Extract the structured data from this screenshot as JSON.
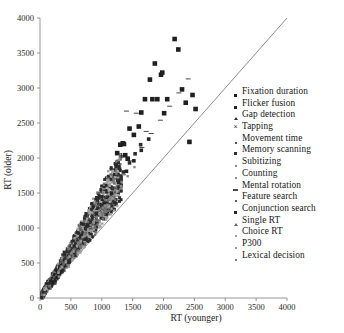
{
  "chart_data": {
    "type": "scatter",
    "title": "",
    "xlabel": "RT (younger)",
    "ylabel": "RT (older)",
    "xlim": [
      0,
      4000
    ],
    "ylim": [
      0,
      4000
    ],
    "xticks": [
      0,
      500,
      1000,
      1500,
      2000,
      2500,
      3000,
      3500,
      4000
    ],
    "yticks": [
      0,
      500,
      1000,
      1500,
      2000,
      2500,
      3000,
      3500,
      4000
    ],
    "grid": false,
    "legend_position": "right",
    "reference_line": {
      "name": "unity-line",
      "slope": 1,
      "intercept": 0
    },
    "series": [
      {
        "name": "Fixation duration",
        "marker": "square",
        "size": "large",
        "color": "#1c1c1c",
        "points": [
          [
            180,
            230
          ],
          [
            210,
            265
          ],
          [
            240,
            300
          ],
          [
            300,
            360
          ],
          [
            330,
            410
          ],
          [
            360,
            455
          ],
          [
            420,
            520
          ],
          [
            470,
            590
          ],
          [
            520,
            660
          ],
          [
            250,
            320
          ],
          [
            290,
            375
          ],
          [
            380,
            470
          ]
        ]
      },
      {
        "name": "Flicker fusion",
        "marker": "square",
        "size": "large",
        "color": "#202020",
        "points": [
          [
            1250,
            2070
          ],
          [
            1300,
            2190
          ],
          [
            1340,
            2210
          ],
          [
            1360,
            2200
          ],
          [
            1380,
            2040
          ],
          [
            1420,
            1990
          ],
          [
            1450,
            2420
          ],
          [
            1520,
            2330
          ],
          [
            1600,
            2450
          ],
          [
            1640,
            2650
          ],
          [
            1700,
            2840
          ],
          [
            1780,
            3120
          ],
          [
            1820,
            2840
          ],
          [
            1860,
            3350
          ],
          [
            1900,
            2840
          ],
          [
            1960,
            3190
          ],
          [
            1980,
            3220
          ],
          [
            2010,
            2640
          ],
          [
            2060,
            2840
          ],
          [
            2180,
            3700
          ],
          [
            2240,
            3550
          ],
          [
            2300,
            2980
          ],
          [
            2360,
            2790
          ],
          [
            2420,
            2230
          ],
          [
            2470,
            2900
          ],
          [
            2520,
            2700
          ]
        ]
      },
      {
        "name": "Gap detection",
        "marker": "triangle",
        "size": "medium",
        "color": "#2a2a2a",
        "points": [
          [
            520,
            700
          ],
          [
            610,
            830
          ],
          [
            690,
            930
          ],
          [
            760,
            1050
          ],
          [
            840,
            1180
          ],
          [
            920,
            1280
          ],
          [
            1010,
            1410
          ],
          [
            1080,
            1520
          ]
        ]
      },
      {
        "name": "Tapping",
        "marker": "x",
        "size": "small",
        "color": "#3a3a3a",
        "points": [
          [
            170,
            220
          ],
          [
            220,
            290
          ],
          [
            280,
            350
          ],
          [
            340,
            430
          ],
          [
            410,
            510
          ],
          [
            480,
            610
          ],
          [
            560,
            710
          ],
          [
            640,
            810
          ],
          [
            730,
            920
          ],
          [
            820,
            1030
          ],
          [
            900,
            1140
          ],
          [
            980,
            1250
          ],
          [
            1060,
            1360
          ],
          [
            1150,
            1470
          ],
          [
            1240,
            1600
          ],
          [
            1320,
            1720
          ]
        ]
      },
      {
        "name": "Movement time",
        "marker": "square",
        "size": "small",
        "color": "#555555",
        "points": [
          [
            230,
            300
          ],
          [
            310,
            400
          ],
          [
            400,
            500
          ],
          [
            490,
            620
          ],
          [
            580,
            730
          ],
          [
            670,
            840
          ],
          [
            760,
            950
          ],
          [
            850,
            1060
          ],
          [
            940,
            1180
          ],
          [
            1030,
            1290
          ],
          [
            1120,
            1400
          ],
          [
            1210,
            1510
          ]
        ]
      },
      {
        "name": "Memory scanning",
        "marker": "square",
        "size": "medium",
        "color": "#2e2e2e",
        "points": [
          [
            420,
            560
          ],
          [
            500,
            660
          ],
          [
            580,
            770
          ],
          [
            670,
            880
          ],
          [
            750,
            990
          ],
          [
            830,
            1100
          ],
          [
            910,
            1210
          ],
          [
            1000,
            1320
          ],
          [
            1090,
            1440
          ],
          [
            1170,
            1560
          ],
          [
            1260,
            1680
          ],
          [
            1350,
            1800
          ],
          [
            1450,
            1930
          ],
          [
            1540,
            2060
          ],
          [
            1630,
            2190
          ]
        ]
      },
      {
        "name": "Subitizing",
        "marker": "square",
        "size": "small",
        "color": "#787878",
        "points": [
          [
            300,
            380
          ],
          [
            380,
            480
          ],
          [
            460,
            580
          ],
          [
            540,
            680
          ],
          [
            620,
            780
          ],
          [
            700,
            880
          ],
          [
            780,
            980
          ],
          [
            860,
            1080
          ],
          [
            940,
            1190
          ],
          [
            1020,
            1290
          ]
        ]
      },
      {
        "name": "Counting",
        "marker": "square",
        "size": "small",
        "color": "#8a8a8a",
        "points": [
          [
            350,
            450
          ],
          [
            450,
            570
          ],
          [
            550,
            690
          ],
          [
            650,
            810
          ],
          [
            760,
            940
          ],
          [
            870,
            1070
          ],
          [
            980,
            1200
          ],
          [
            1090,
            1330
          ],
          [
            1200,
            1470
          ],
          [
            1310,
            1600
          ],
          [
            1420,
            1740
          ],
          [
            1530,
            1870
          ]
        ]
      },
      {
        "name": "Mental rotation",
        "marker": "dash",
        "size": "medium",
        "color": "#4a4a4a",
        "points": [
          [
            900,
            1180
          ],
          [
            1050,
            1380
          ],
          [
            1200,
            1570
          ],
          [
            1350,
            1760
          ],
          [
            1500,
            1960
          ],
          [
            1650,
            2150
          ],
          [
            1800,
            2350
          ],
          [
            1950,
            2540
          ],
          [
            2100,
            2740
          ],
          [
            2250,
            2930
          ],
          [
            1400,
            2670
          ],
          [
            1560,
            2640
          ],
          [
            1720,
            2380
          ],
          [
            2400,
            3130
          ]
        ]
      },
      {
        "name": "Feature search",
        "marker": "square",
        "size": "small",
        "color": "#606060",
        "points": [
          [
            380,
            490
          ],
          [
            470,
            600
          ],
          [
            560,
            710
          ],
          [
            650,
            820
          ],
          [
            740,
            930
          ],
          [
            830,
            1050
          ],
          [
            920,
            1160
          ],
          [
            1010,
            1270
          ],
          [
            1100,
            1390
          ]
        ]
      },
      {
        "name": "Conjunction search",
        "marker": "square",
        "size": "medium",
        "color": "#242424",
        "points": [
          [
            560,
            740
          ],
          [
            680,
            890
          ],
          [
            800,
            1040
          ],
          [
            920,
            1190
          ],
          [
            1040,
            1350
          ],
          [
            1160,
            1500
          ],
          [
            1280,
            1650
          ],
          [
            1400,
            1810
          ],
          [
            1520,
            1960
          ],
          [
            1640,
            2110
          ],
          [
            1760,
            2270
          ]
        ]
      },
      {
        "name": "Single RT",
        "marker": "triangle",
        "size": "small",
        "color": "#666666",
        "points": [
          [
            210,
            270
          ],
          [
            260,
            330
          ],
          [
            310,
            390
          ],
          [
            360,
            450
          ],
          [
            410,
            520
          ],
          [
            460,
            580
          ],
          [
            510,
            640
          ],
          [
            560,
            710
          ]
        ]
      },
      {
        "name": "Choice RT",
        "marker": "square",
        "size": "small",
        "color": "#909090",
        "points": [
          [
            330,
            420
          ],
          [
            420,
            530
          ],
          [
            510,
            640
          ],
          [
            600,
            750
          ],
          [
            690,
            870
          ],
          [
            780,
            980
          ],
          [
            870,
            1090
          ],
          [
            960,
            1200
          ],
          [
            1050,
            1320
          ],
          [
            1140,
            1430
          ]
        ]
      },
      {
        "name": "P300",
        "marker": "square",
        "size": "small",
        "color": "#9a9a9a",
        "points": [
          [
            300,
            360
          ],
          [
            360,
            440
          ],
          [
            420,
            510
          ],
          [
            480,
            590
          ],
          [
            540,
            660
          ],
          [
            600,
            740
          ],
          [
            660,
            810
          ],
          [
            720,
            890
          ],
          [
            780,
            960
          ]
        ]
      },
      {
        "name": "Lexical decision",
        "marker": "square",
        "size": "small",
        "color": "#7e7e7e",
        "points": [
          [
            520,
            660
          ],
          [
            620,
            790
          ],
          [
            720,
            910
          ],
          [
            820,
            1040
          ],
          [
            920,
            1160
          ],
          [
            1020,
            1290
          ],
          [
            1120,
            1410
          ],
          [
            1220,
            1540
          ],
          [
            1320,
            1660
          ]
        ]
      }
    ],
    "cluster_note": "Dense overlapping cluster of gray and dark points along the diagonal between 0 and 1300 on x"
  },
  "axes": {
    "x_title": "RT (younger)",
    "y_title": "RT (older)",
    "x_ticks": [
      "0",
      "500",
      "1000",
      "1500",
      "2000",
      "2500",
      "3000",
      "3500",
      "4000"
    ],
    "y_ticks": [
      "0",
      "500",
      "1000",
      "1500",
      "2000",
      "2500",
      "3000",
      "3500",
      "4000"
    ]
  },
  "legend": {
    "items": [
      {
        "label": "Fixation duration",
        "marker": "square",
        "size": "md",
        "color": "#1c1c1c"
      },
      {
        "label": "Flicker fusion",
        "marker": "square",
        "size": "md",
        "color": "#202020"
      },
      {
        "label": "Gap detection",
        "marker": "triangle",
        "size": "sm",
        "color": "#2a2a2a"
      },
      {
        "label": "Tapping",
        "marker": "x",
        "size": "sm",
        "color": "#3a3a3a"
      },
      {
        "label": "Movement time",
        "marker": "square",
        "size": "sm",
        "color": "#555555"
      },
      {
        "label": "Memory scanning",
        "marker": "square",
        "size": "md",
        "color": "#2e2e2e"
      },
      {
        "label": "Subitizing",
        "marker": "square",
        "size": "sm",
        "color": "#8a8a8a"
      },
      {
        "label": "Counting",
        "marker": "square",
        "size": "sm",
        "color": "#909090"
      },
      {
        "label": "Mental rotation",
        "marker": "dash",
        "size": "sm",
        "color": "#4a4a4a"
      },
      {
        "label": "Feature search",
        "marker": "square",
        "size": "sm",
        "color": "#606060"
      },
      {
        "label": "Conjunction search",
        "marker": "square",
        "size": "md",
        "color": "#242424"
      },
      {
        "label": "Single RT",
        "marker": "triangle",
        "size": "sm",
        "color": "#666666"
      },
      {
        "label": "Choice RT",
        "marker": "square",
        "size": "sm",
        "color": "#9a9a9a"
      },
      {
        "label": "P300",
        "marker": "square",
        "size": "sm",
        "color": "#9a9a9a"
      },
      {
        "label": "Lexical decision",
        "marker": "square",
        "size": "sm",
        "color": "#7e7e7e"
      }
    ]
  }
}
